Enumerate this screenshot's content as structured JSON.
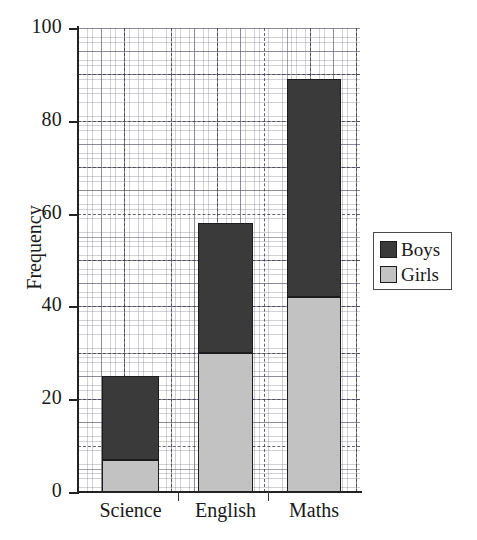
{
  "chart_data": {
    "type": "bar",
    "subtype": "stacked-vertical",
    "title": "",
    "xlabel": "",
    "ylabel": "Frequency",
    "categories": [
      "Science",
      "English",
      "Maths"
    ],
    "series": [
      {
        "name": "Girls",
        "values": [
          7,
          30,
          42
        ],
        "color": "#c2c2c2"
      },
      {
        "name": "Boys",
        "values": [
          18,
          28,
          47
        ],
        "color": "#3a3a3a"
      }
    ],
    "stacked_totals": [
      25,
      58,
      89
    ],
    "ylim": [
      0,
      100
    ],
    "yticks": [
      0,
      20,
      40,
      60,
      80,
      100
    ],
    "ytick_labels": [
      "0",
      "20",
      "40",
      "60",
      "80",
      "100"
    ],
    "major_gridlines_every": 10,
    "minor_gridlines_every": 1,
    "grid": true,
    "legend_position": "right",
    "legend_entries": [
      {
        "label": "Boys",
        "color": "#3a3a3a"
      },
      {
        "label": "Girls",
        "color": "#c2c2c2"
      }
    ]
  },
  "axes": {
    "y_label": "Frequency",
    "y_tick_labels": [
      "100",
      "80",
      "60",
      "40",
      "20",
      "0"
    ],
    "x_tick_labels": [
      "Science",
      "English",
      "Maths"
    ]
  },
  "legend": {
    "boys_label": "Boys",
    "girls_label": "Girls"
  }
}
